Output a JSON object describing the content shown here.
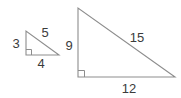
{
  "figure": {
    "background_color": "#ffffff",
    "stroke_color": "#8d8d8d",
    "text_color": "#3b3b3b",
    "shapes": [
      {
        "name": "small-right-triangle",
        "type": "right-triangle",
        "right_angle_vertex": "bottom-left",
        "vertices": {
          "apex": [
            26,
            31
          ],
          "right_angle": [
            26,
            55
          ],
          "base_end": [
            59,
            55
          ]
        },
        "labels": {
          "vertical_leg": "3",
          "horizontal_leg": "4",
          "hypotenuse": "5"
        }
      },
      {
        "name": "large-right-triangle",
        "type": "right-triangle",
        "right_angle_vertex": "bottom-left",
        "vertices": {
          "apex": [
            78,
            8
          ],
          "right_angle": [
            78,
            77
          ],
          "base_end": [
            175,
            77
          ]
        },
        "labels": {
          "vertical_leg": "9",
          "horizontal_leg": "12",
          "hypotenuse": "15"
        }
      }
    ]
  }
}
